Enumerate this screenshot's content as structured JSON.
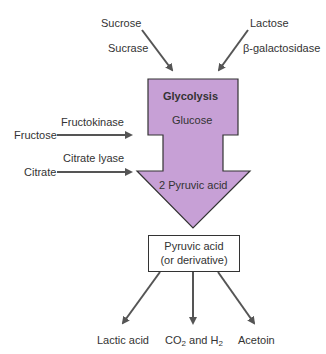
{
  "diagram": {
    "title": "Glycolysis",
    "colors": {
      "main_arrow_fill": "#c7a0d6",
      "stroke": "#333333",
      "arrow": "#555555"
    },
    "main_arrow": {
      "title": "Glycolysis",
      "top_label": "Glucose",
      "bottom_label": "2 Pyruvic acid"
    },
    "inputs": [
      {
        "substrate": "Sucrose",
        "enzyme": "Sucrase"
      },
      {
        "substrate": "Lactose",
        "enzyme": "β-galactosidase"
      },
      {
        "substrate": "Fructose",
        "enzyme": "Fructokinase"
      },
      {
        "substrate": "Citrate",
        "enzyme": "Citrate lyase"
      }
    ],
    "product_box": {
      "line1": "Pyruvic acid",
      "line2": "(or derivative)"
    },
    "outputs": [
      {
        "label": "Lactic acid"
      },
      {
        "label_main": "CO",
        "sub1": "2",
        "label_mid": " and H",
        "sub2": "2"
      },
      {
        "label": "Acetoin"
      }
    ]
  }
}
